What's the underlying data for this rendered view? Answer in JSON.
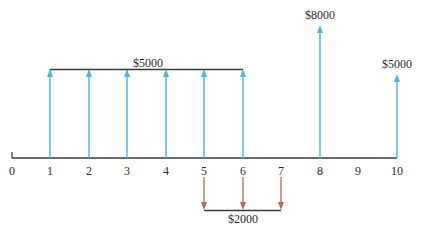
{
  "diagram": {
    "type": "cash-flow-diagram",
    "axis": {
      "periods": [
        "0",
        "1",
        "2",
        "3",
        "4",
        "5",
        "6",
        "7",
        "8",
        "9",
        "10"
      ],
      "color": "#3a3a3a"
    },
    "colors": {
      "inflow": "#4fb3df",
      "outflow": "#b56a55",
      "bracket": "#3a3a3a",
      "text": "#2b2b2b"
    },
    "inflows": [
      {
        "period": 1,
        "amount": 5000
      },
      {
        "period": 2,
        "amount": 5000
      },
      {
        "period": 3,
        "amount": 5000
      },
      {
        "period": 4,
        "amount": 5000
      },
      {
        "period": 5,
        "amount": 5000
      },
      {
        "period": 6,
        "amount": 5000
      },
      {
        "period": 8,
        "amount": 8000
      },
      {
        "period": 10,
        "amount": 5000
      }
    ],
    "outflows": [
      {
        "period": 5,
        "amount": 2000
      },
      {
        "period": 6,
        "amount": 2000
      },
      {
        "period": 7,
        "amount": 2000
      }
    ],
    "labels": {
      "inflow_group": "$5000",
      "inflow_p8": "$8000",
      "inflow_p10": "$5000",
      "outflow_group": "$2000"
    }
  }
}
